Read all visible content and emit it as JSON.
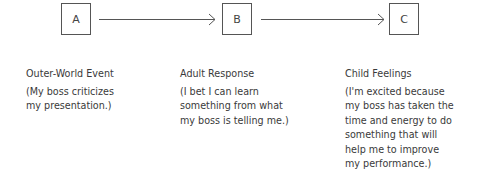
{
  "diagram": {
    "nodes": [
      {
        "id": "A",
        "label": "A"
      },
      {
        "id": "B",
        "label": "B"
      },
      {
        "id": "C",
        "label": "C"
      }
    ],
    "edges": [
      {
        "from": "A",
        "to": "B"
      },
      {
        "from": "B",
        "to": "C"
      }
    ],
    "columns": [
      {
        "heading": "Outer-World Event",
        "body": "(My boss criticizes\nmy presentation.)"
      },
      {
        "heading": "Adult Response",
        "body": "(I bet I can learn\nsomething from what\nmy boss is telling me.)"
      },
      {
        "heading": "Child Feelings",
        "body": "(I'm excited because\nmy boss has taken the\ntime and energy to do\nsomething that will\nhelp me to improve\nmy performance.)"
      }
    ]
  }
}
